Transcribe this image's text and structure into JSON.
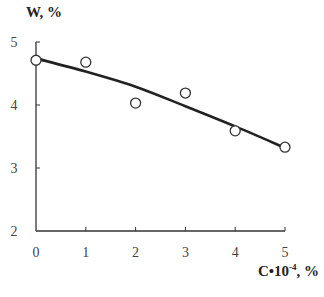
{
  "chart_data": {
    "type": "scatter",
    "title": "",
    "xlabel": "C•10⁻⁴, %",
    "xlabel_parts": {
      "base": "C•10",
      "exp": "-4",
      "suffix": ", %"
    },
    "ylabel": "W, %",
    "xlim": [
      0,
      5
    ],
    "ylim": [
      2,
      5
    ],
    "x_ticks": [
      "0",
      "1",
      "2",
      "3",
      "4",
      "5"
    ],
    "y_ticks": [
      "2",
      "3",
      "4",
      "5"
    ],
    "grid": false,
    "legend": null,
    "series": [
      {
        "name": "Experimental points",
        "style": "open-circle markers",
        "x": [
          0,
          1,
          2,
          3,
          4,
          5
        ],
        "y": [
          4.71,
          4.68,
          4.03,
          4.19,
          3.59,
          3.33
        ]
      },
      {
        "name": "Fitted curve",
        "style": "solid black line",
        "x": [
          0,
          1,
          2,
          3,
          4,
          5
        ],
        "y": [
          4.74,
          4.53,
          4.29,
          3.98,
          3.66,
          3.32
        ]
      }
    ]
  },
  "axes": {
    "y_label": "W, %",
    "x_label_base": "C•10",
    "x_label_exp": "-4",
    "x_label_suffix": ", %"
  },
  "colors": {
    "line": "#222222",
    "marker_stroke": "#333333",
    "axis": "#333333"
  }
}
